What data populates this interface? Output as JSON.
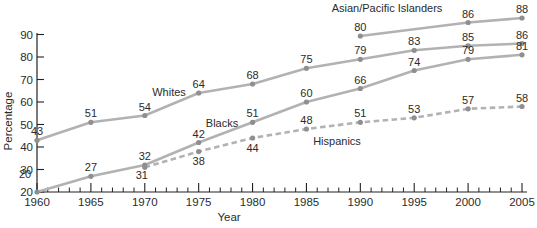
{
  "chart_data": {
    "type": "line",
    "title": "",
    "xlabel": "Year",
    "ylabel": "Percentage",
    "x_ticks": [
      1960,
      1965,
      1970,
      1975,
      1980,
      1985,
      1990,
      1995,
      2000,
      2005
    ],
    "y_ticks": [
      20,
      30,
      40,
      50,
      60,
      70,
      80,
      90
    ],
    "xlim": [
      1960,
      2005
    ],
    "ylim": [
      20,
      90
    ],
    "grid": false,
    "legend_position": "inline-line-labels",
    "series": [
      {
        "id": "whites",
        "name": "Whites",
        "line_style": "solid",
        "x": [
          1960,
          1965,
          1970,
          1975,
          1980,
          1985,
          1990,
          1995,
          2000,
          2005
        ],
        "values": [
          43,
          51,
          54,
          64,
          68,
          75,
          79,
          83,
          85,
          86
        ]
      },
      {
        "id": "blacks",
        "name": "Blacks",
        "line_style": "solid",
        "x": [
          1960,
          1965,
          1970,
          1975,
          1980,
          1985,
          1990,
          1995,
          2000,
          2005
        ],
        "values": [
          20,
          27,
          32,
          42,
          51,
          60,
          66,
          74,
          79,
          81
        ]
      },
      {
        "id": "hispanics",
        "name": "Hispanics",
        "line_style": "dashed",
        "x": [
          1970,
          1975,
          1980,
          1985,
          1990,
          1995,
          2000,
          2005
        ],
        "values": [
          31,
          38,
          44,
          48,
          51,
          53,
          57,
          58
        ]
      },
      {
        "id": "asian_pacific_islanders",
        "name": "Asian/Pacific Islanders",
        "line_style": "solid",
        "x": [
          1990,
          2000,
          2005
        ],
        "values": [
          80,
          86,
          88
        ]
      }
    ]
  },
  "colors": {
    "line": "#b2b2b2",
    "marker": "#8f8f8f",
    "text": "#2b2b2b",
    "axis": "#222222",
    "background": "#ffffff"
  }
}
